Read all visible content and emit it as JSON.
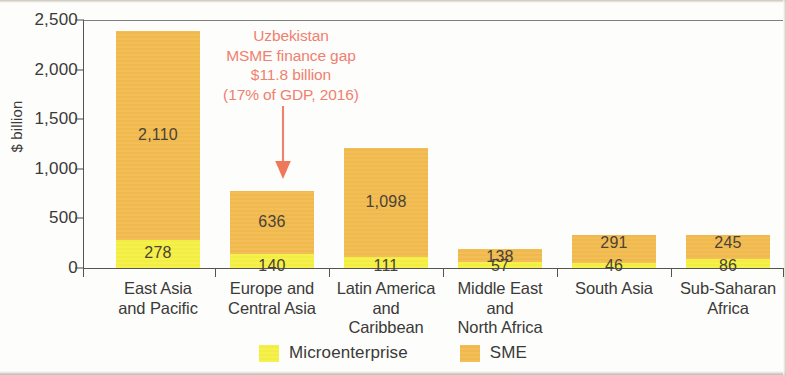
{
  "chart_data": {
    "type": "bar",
    "subtype": "stacked-column",
    "title": "",
    "xlabel": "",
    "ylabel": "$ billion",
    "ylim": [
      0,
      2500
    ],
    "yticks": [
      "0",
      "500",
      "1,000",
      "1,500",
      "2,000",
      "2,500"
    ],
    "ytick_values": [
      0,
      500,
      1000,
      1500,
      2000,
      2500
    ],
    "grid": false,
    "legend_position": "bottom",
    "categories": [
      "East Asia\nand Pacific",
      "Europe and\nCentral Asia",
      "Latin America\nand\nCaribbean",
      "Middle East\nand\nNorth Africa",
      "South Asia",
      "Sub-Saharan\nAfrica"
    ],
    "series": [
      {
        "name": "Microenterprise",
        "color": "#f5f043",
        "values": [
          278,
          140,
          111,
          57,
          46,
          86
        ],
        "labels": [
          "278",
          "140",
          "111",
          "57",
          "46",
          "86"
        ]
      },
      {
        "name": "SME",
        "color": "#f2bb4f",
        "values": [
          2110,
          636,
          1098,
          138,
          291,
          245
        ],
        "labels": [
          "2,110",
          "636",
          "1,098",
          "138",
          "291",
          "245"
        ]
      }
    ],
    "annotations": [
      {
        "name": "uzbekistan-callout",
        "lines": [
          "Uzbekistan",
          "MSME finance gap",
          "$11.8 billion",
          "(17% of GDP, 2016)"
        ],
        "color": "#f08070",
        "points_to": "Europe and Central Asia"
      }
    ]
  },
  "axis": {
    "y_label": "$ billion",
    "y_ticks": [
      {
        "label": "2,500",
        "value": 2500
      },
      {
        "label": "2,000",
        "value": 2000
      },
      {
        "label": "1,500",
        "value": 1500
      },
      {
        "label": "1,000",
        "value": 1000
      },
      {
        "label": "500",
        "value": 500
      },
      {
        "label": "0",
        "value": 0
      }
    ]
  },
  "categories": [
    {
      "id": "east-asia-pacific",
      "line1": "East Asia",
      "line2": "and Pacific",
      "line3": ""
    },
    {
      "id": "europe-central-asia",
      "line1": "Europe and",
      "line2": "Central Asia",
      "line3": ""
    },
    {
      "id": "latin-america",
      "line1": "Latin America",
      "line2": "and",
      "line3": "Caribbean"
    },
    {
      "id": "middle-east-n-africa",
      "line1": "Middle East",
      "line2": "and",
      "line3": "North Africa"
    },
    {
      "id": "south-asia",
      "line1": "South Asia",
      "line2": "",
      "line3": ""
    },
    {
      "id": "sub-saharan-africa",
      "line1": "Sub-Saharan",
      "line2": "Africa",
      "line3": ""
    }
  ],
  "bars": [
    {
      "id": "east-asia-pacific",
      "sme_label": "2,110",
      "micro_label": "278"
    },
    {
      "id": "europe-central-asia",
      "sme_label": "636",
      "micro_label": "140"
    },
    {
      "id": "latin-america",
      "sme_label": "1,098",
      "micro_label": "111"
    },
    {
      "id": "middle-east-n-africa",
      "sme_label": "138",
      "micro_label": "57"
    },
    {
      "id": "south-asia",
      "sme_label": "291",
      "micro_label": "46"
    },
    {
      "id": "sub-saharan-africa",
      "sme_label": "245",
      "micro_label": "86"
    }
  ],
  "annotation": {
    "line1": "Uzbekistan",
    "line2": "MSME finance gap",
    "line3": "$11.8 billion",
    "line4": "(17% of GDP, 2016)",
    "color": "#f08070"
  },
  "legend": {
    "items": [
      {
        "id": "microenterprise",
        "label": "Microenterprise",
        "color": "#f5f043"
      },
      {
        "id": "sme",
        "label": "SME",
        "color": "#f2bb4f"
      }
    ]
  }
}
